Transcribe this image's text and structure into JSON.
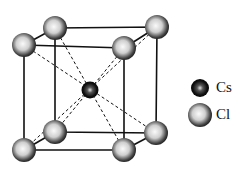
{
  "diagram": {
    "legend": [
      {
        "label": "Cs",
        "symbol": "small-dark-sphere"
      },
      {
        "label": "Cl",
        "symbol": "large-grey-sphere"
      }
    ],
    "colors": {
      "line": "#111111",
      "sphere_dark": "#111111",
      "sphere_light": "#f2f2f2"
    }
  }
}
